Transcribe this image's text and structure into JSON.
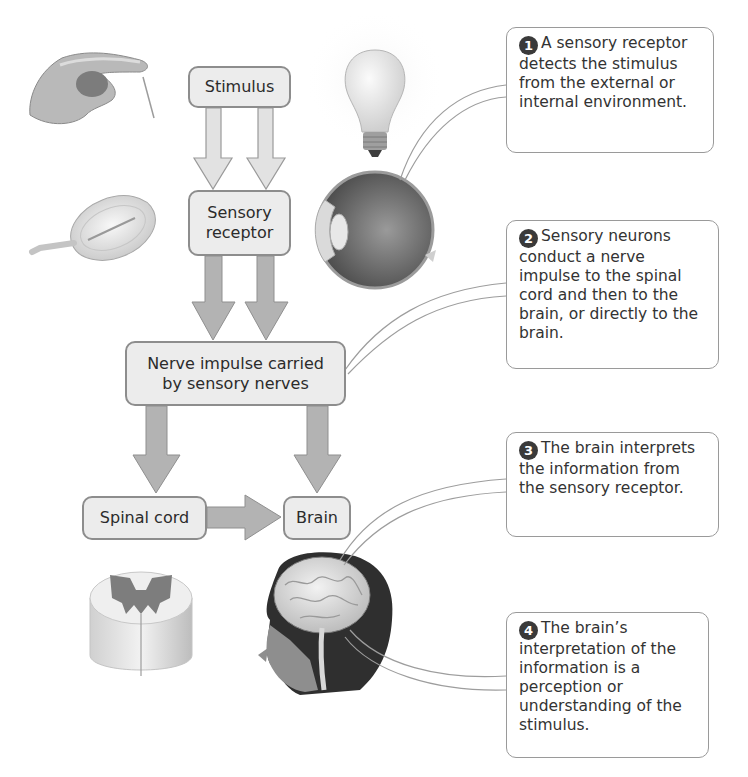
{
  "diagram": {
    "flow_nodes": {
      "stimulus": "Stimulus",
      "sensory_receptor_line1": "Sensory",
      "sensory_receptor_line2": "receptor",
      "nerve_impulse_line1": "Nerve impulse carried",
      "nerve_impulse_line2": "by sensory nerves",
      "spinal_cord": "Spinal cord",
      "brain": "Brain"
    },
    "edges": [
      {
        "from": "Stimulus",
        "to": "Sensory receptor",
        "count": 2,
        "style": "light"
      },
      {
        "from": "Sensory receptor",
        "to": "Nerve impulse carried by sensory nerves",
        "count": 2,
        "style": "dark"
      },
      {
        "from": "Nerve impulse carried by sensory nerves",
        "to": "Spinal cord"
      },
      {
        "from": "Nerve impulse carried by sensory nerves",
        "to": "Brain"
      },
      {
        "from": "Spinal cord",
        "to": "Brain"
      }
    ],
    "callouts": [
      {
        "number": "1",
        "text": "A sensory receptor detects the stimulus from the external or internal environment."
      },
      {
        "number": "2",
        "text": "Sensory neurons conduct a nerve impulse to the spinal cord and then to the brain, or directly to the brain."
      },
      {
        "number": "3",
        "text": "The brain interprets the information from the sensory receptor."
      },
      {
        "number": "4",
        "text": "The brain’s interpretation of the information is a perception or understanding of the stimulus."
      }
    ],
    "illustrations": [
      "hand-pin-illustration",
      "pacinian-corpuscle-illustration",
      "light-bulb-illustration",
      "eye-cross-section-illustration",
      "spinal-cord-section-illustration",
      "head-with-brain-illustration"
    ],
    "colors": {
      "node_fill": "#ececec",
      "node_border": "#8d8d8d",
      "light_arrow": "#e2e2e2",
      "dark_arrow": "#b3b3b3",
      "callout_border": "#9a9a9a",
      "number_badge": "#3a3a3a"
    }
  }
}
